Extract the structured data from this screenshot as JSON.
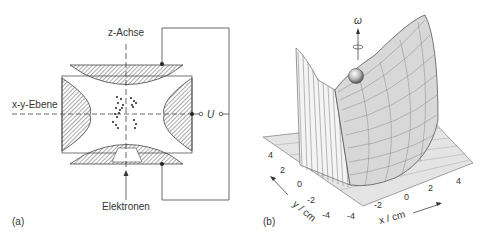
{
  "panel_a": {
    "label": "(a)",
    "z_axis_label": "z-Achse",
    "xy_plane_label": "x-y-Ebene",
    "voltage_label": "U",
    "electrons_label": "Elektronen"
  },
  "panel_b": {
    "label": "(b)",
    "rotation_label": "ω",
    "x_axis_label": "x / cm",
    "y_axis_label": "y / cm",
    "x_ticks": [
      "-4",
      "-2",
      "0",
      "2",
      "4"
    ],
    "y_ticks": [
      "-4",
      "-2",
      "0",
      "2",
      "4"
    ]
  }
}
